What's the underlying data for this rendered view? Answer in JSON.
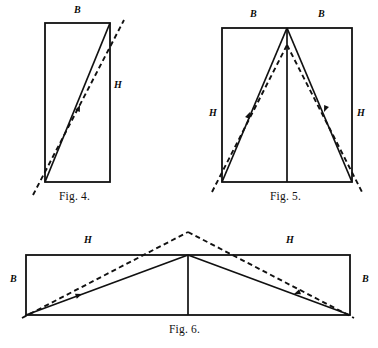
{
  "page": {
    "background_color": "#ffffff",
    "ink_color": "#111111",
    "width": 378,
    "height": 348
  },
  "figures": [
    {
      "id": "fig4",
      "caption": "Fig. 4.",
      "caption_x": 59,
      "caption_y": 190,
      "description": "Upright rectangle with a solid diagonal from bottom-left to top-right and a dashed line of slightly shallower slope crossing it and extending beyond both corners.",
      "rect": {
        "x": 45,
        "y": 23,
        "width": 65,
        "height": 159
      },
      "solid_segments": [
        {
          "name": "diagonal",
          "x1": 45,
          "y1": 182,
          "x2": 110,
          "y2": 23
        }
      ],
      "dashed_segments": [
        {
          "name": "shifted-diagonal",
          "x1": 33,
          "y1": 195,
          "x2": 124,
          "y2": 20
        }
      ],
      "arrows": [
        {
          "name": "diagonal-arrow",
          "x": 80,
          "y": 105,
          "angle": -67
        }
      ],
      "labels": [
        {
          "text": "B",
          "x": 74,
          "y": 10,
          "name": "label-b-top"
        },
        {
          "text": "H",
          "x": 114,
          "y": 85,
          "name": "label-h-right"
        }
      ]
    },
    {
      "id": "fig5",
      "caption": "Fig. 5.",
      "caption_x": 270,
      "caption_y": 190,
      "description": "Upright rectangle containing a solid isosceles triangle with apex at the top centre, a vertical centre line, and dashed lines forming a slightly narrower peak that crosses the solid sides and runs past the lower corners.",
      "rect": {
        "x": 222,
        "y": 28,
        "width": 130,
        "height": 154
      },
      "solid_segments": [
        {
          "name": "triangle-left-side",
          "x1": 222,
          "y1": 182,
          "x2": 287,
          "y2": 28
        },
        {
          "name": "triangle-right-side",
          "x1": 287,
          "y1": 28,
          "x2": 352,
          "y2": 182
        },
        {
          "name": "centre-vertical",
          "x1": 287,
          "y1": 28,
          "x2": 287,
          "y2": 182
        }
      ],
      "dashed_segments": [
        {
          "name": "dashed-left-side",
          "x1": 212,
          "y1": 192,
          "x2": 287,
          "y2": 45
        },
        {
          "name": "dashed-right-side",
          "x1": 287,
          "y1": 45,
          "x2": 362,
          "y2": 192
        }
      ],
      "arrows": [
        {
          "name": "left-side-arrow",
          "x": 250,
          "y": 112,
          "angle": -67
        },
        {
          "name": "right-side-arrow",
          "x": 324,
          "y": 112,
          "angle": 113
        }
      ],
      "labels": [
        {
          "text": "B",
          "x": 250,
          "y": 14,
          "name": "label-b-top-left"
        },
        {
          "text": "B",
          "x": 318,
          "y": 14,
          "name": "label-b-top-right"
        },
        {
          "text": "H",
          "x": 209,
          "y": 113,
          "name": "label-h-left"
        },
        {
          "text": "H",
          "x": 357,
          "y": 113,
          "name": "label-h-right"
        }
      ]
    },
    {
      "id": "fig6",
      "caption": "Fig. 6.",
      "caption_x": 169,
      "caption_y": 323,
      "description": "Wide flat rectangle containing a solid low triangle with apex at the top centre, a short vertical centre line, and dashed lines forming a taller peak that rises above the rectangle.",
      "rect": {
        "x": 26,
        "y": 255,
        "width": 324,
        "height": 60
      },
      "solid_segments": [
        {
          "name": "triangle-left-side",
          "x1": 26,
          "y1": 315,
          "x2": 188,
          "y2": 255
        },
        {
          "name": "triangle-right-side",
          "x1": 188,
          "y1": 255,
          "x2": 350,
          "y2": 315
        },
        {
          "name": "centre-vertical",
          "x1": 188,
          "y1": 255,
          "x2": 188,
          "y2": 315
        }
      ],
      "dashed_segments": [
        {
          "name": "dashed-left-side",
          "x1": 22,
          "y1": 318,
          "x2": 188,
          "y2": 232
        },
        {
          "name": "dashed-right-side",
          "x1": 188,
          "y1": 232,
          "x2": 354,
          "y2": 318
        }
      ],
      "arrows": [
        {
          "name": "left-side-arrow",
          "x": 82,
          "y": 294,
          "angle": -20
        },
        {
          "name": "right-side-arrow",
          "x": 294,
          "y": 294,
          "angle": 160
        }
      ],
      "labels": [
        {
          "text": "H",
          "x": 84,
          "y": 240,
          "name": "label-h-left"
        },
        {
          "text": "H",
          "x": 286,
          "y": 240,
          "name": "label-h-right"
        },
        {
          "text": "B",
          "x": 10,
          "y": 279,
          "name": "label-b-left"
        },
        {
          "text": "B",
          "x": 362,
          "y": 279,
          "name": "label-b-right"
        }
      ]
    }
  ]
}
